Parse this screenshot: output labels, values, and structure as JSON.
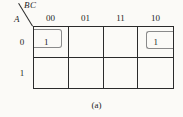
{
  "kmap": {
    "col_var": "BC",
    "row_var": "A",
    "col_headers": [
      "00",
      "01",
      "11",
      "10"
    ],
    "row_headers": [
      "0",
      "1"
    ],
    "cells": [
      [
        "1",
        "",
        "",
        "1"
      ],
      [
        "",
        "",
        "",
        ""
      ]
    ],
    "caption": "(a)"
  },
  "colors": {
    "line": "#2b2b2b",
    "loop": "#8a8a8a",
    "bg": "#fbfaf7",
    "ink": "#1f1f1f"
  }
}
